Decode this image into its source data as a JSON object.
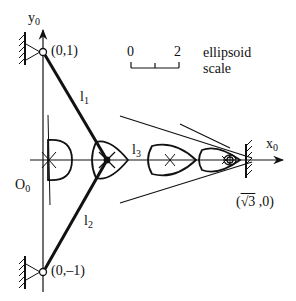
{
  "figure": {
    "axes": {
      "y_label": "y",
      "y_sub": "0",
      "x_label": "x",
      "x_sub": "0",
      "origin_label": "O",
      "origin_sub": "0"
    },
    "points": {
      "top_pivot": "(0,1)",
      "bottom_pivot": "(0,–1)",
      "right_wall_prefix": "(",
      "right_wall_root": "√3",
      "right_wall_suffix": " ,0)"
    },
    "links": {
      "l1": "l",
      "l1_sub": "1",
      "l2": "l",
      "l2_sub": "2",
      "l3": "l",
      "l3_sub": "3"
    },
    "scale": {
      "start": "0",
      "end": "2",
      "caption_line1": "ellipsoid",
      "caption_line2": "scale"
    },
    "colors": {
      "ink": "#111111",
      "background": "#ffffff"
    }
  }
}
